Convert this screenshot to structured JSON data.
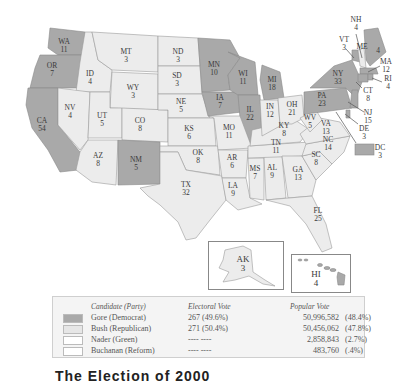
{
  "map": {
    "title": "2000 Presidential Election Results",
    "colors": {
      "gore": "#a9a9a9",
      "bush": "#ececec",
      "nader": "#ffffff",
      "buchanan": "#ffffff"
    },
    "states": [
      {
        "abbr": "WA",
        "ev": "11",
        "winner": "gore"
      },
      {
        "abbr": "OR",
        "ev": "7",
        "winner": "gore"
      },
      {
        "abbr": "CA",
        "ev": "54",
        "winner": "gore"
      },
      {
        "abbr": "ID",
        "ev": "4",
        "winner": "bush"
      },
      {
        "abbr": "NV",
        "ev": "4",
        "winner": "bush"
      },
      {
        "abbr": "MT",
        "ev": "3",
        "winner": "bush"
      },
      {
        "abbr": "WY",
        "ev": "3",
        "winner": "bush"
      },
      {
        "abbr": "UT",
        "ev": "5",
        "winner": "bush"
      },
      {
        "abbr": "AZ",
        "ev": "8",
        "winner": "bush"
      },
      {
        "abbr": "CO",
        "ev": "8",
        "winner": "bush"
      },
      {
        "abbr": "NM",
        "ev": "5",
        "winner": "gore"
      },
      {
        "abbr": "ND",
        "ev": "3",
        "winner": "bush"
      },
      {
        "abbr": "SD",
        "ev": "3",
        "winner": "bush"
      },
      {
        "abbr": "NE",
        "ev": "5",
        "winner": "bush"
      },
      {
        "abbr": "KS",
        "ev": "6",
        "winner": "bush"
      },
      {
        "abbr": "OK",
        "ev": "8",
        "winner": "bush"
      },
      {
        "abbr": "TX",
        "ev": "32",
        "winner": "bush"
      },
      {
        "abbr": "MN",
        "ev": "10",
        "winner": "gore"
      },
      {
        "abbr": "IA",
        "ev": "7",
        "winner": "gore"
      },
      {
        "abbr": "MO",
        "ev": "11",
        "winner": "bush"
      },
      {
        "abbr": "AR",
        "ev": "6",
        "winner": "bush"
      },
      {
        "abbr": "LA",
        "ev": "9",
        "winner": "bush"
      },
      {
        "abbr": "WI",
        "ev": "11",
        "winner": "gore"
      },
      {
        "abbr": "IL",
        "ev": "22",
        "winner": "gore"
      },
      {
        "abbr": "MI",
        "ev": "18",
        "winner": "gore"
      },
      {
        "abbr": "IN",
        "ev": "12",
        "winner": "bush"
      },
      {
        "abbr": "OH",
        "ev": "21",
        "winner": "bush"
      },
      {
        "abbr": "KY",
        "ev": "8",
        "winner": "bush"
      },
      {
        "abbr": "TN",
        "ev": "11",
        "winner": "bush"
      },
      {
        "abbr": "MS",
        "ev": "7",
        "winner": "bush"
      },
      {
        "abbr": "AL",
        "ev": "9",
        "winner": "bush"
      },
      {
        "abbr": "GA",
        "ev": "13",
        "winner": "bush"
      },
      {
        "abbr": "FL",
        "ev": "25",
        "winner": "bush"
      },
      {
        "abbr": "SC",
        "ev": "8",
        "winner": "bush"
      },
      {
        "abbr": "NC",
        "ev": "14",
        "winner": "bush"
      },
      {
        "abbr": "VA",
        "ev": "13",
        "winner": "bush"
      },
      {
        "abbr": "WV",
        "ev": "5",
        "winner": "bush"
      },
      {
        "abbr": "PA",
        "ev": "23",
        "winner": "gore"
      },
      {
        "abbr": "NY",
        "ev": "33",
        "winner": "gore"
      },
      {
        "abbr": "VT",
        "ev": "3",
        "winner": "gore"
      },
      {
        "abbr": "NH",
        "ev": "4",
        "winner": "bush"
      },
      {
        "abbr": "ME",
        "ev": "4",
        "winner": "gore"
      },
      {
        "abbr": "MA",
        "ev": "12",
        "winner": "gore"
      },
      {
        "abbr": "RI",
        "ev": "4",
        "winner": "gore"
      },
      {
        "abbr": "CT",
        "ev": "8",
        "winner": "gore"
      },
      {
        "abbr": "NJ",
        "ev": "15",
        "winner": "gore"
      },
      {
        "abbr": "DE",
        "ev": "3",
        "winner": "gore"
      },
      {
        "abbr": "DC",
        "ev": "3",
        "winner": "gore"
      },
      {
        "abbr": "AK",
        "ev": "3",
        "winner": "bush"
      },
      {
        "abbr": "HI",
        "ev": "4",
        "winner": "gore"
      }
    ]
  },
  "labels": {
    "WA": [
      "WA",
      "11"
    ],
    "OR": [
      "OR",
      "7"
    ],
    "CA": [
      "CA",
      "54"
    ],
    "ID": [
      "ID",
      "4"
    ],
    "NV": [
      "NV",
      "4"
    ],
    "MT": [
      "MT",
      "3"
    ],
    "WY": [
      "WY",
      "3"
    ],
    "UT": [
      "UT",
      "5"
    ],
    "AZ": [
      "AZ",
      "8"
    ],
    "CO": [
      "CO",
      "8"
    ],
    "NM": [
      "NM",
      "5"
    ],
    "ND": [
      "ND",
      "3"
    ],
    "SD": [
      "SD",
      "3"
    ],
    "NE": [
      "NE",
      "5"
    ],
    "KS": [
      "KS",
      "6"
    ],
    "OK": [
      "OK",
      "8"
    ],
    "TX": [
      "TX",
      "32"
    ],
    "MN": [
      "MN",
      "10"
    ],
    "IA": [
      "IA",
      "7"
    ],
    "MO": [
      "MO",
      "11"
    ],
    "AR": [
      "AR",
      "6"
    ],
    "LA": [
      "LA",
      "9"
    ],
    "WI": [
      "WI",
      "11"
    ],
    "IL": [
      "IL",
      "22"
    ],
    "MI": [
      "MI",
      "18"
    ],
    "IN": [
      "IN",
      "12"
    ],
    "OH": [
      "OH",
      "21"
    ],
    "KY": [
      "KY",
      "8"
    ],
    "TN": [
      "TN",
      "11"
    ],
    "MS": [
      "MS",
      "7"
    ],
    "AL": [
      "AL",
      "9"
    ],
    "GA": [
      "GA",
      "13"
    ],
    "FL": [
      "FL",
      "25"
    ],
    "SC": [
      "SC",
      "8"
    ],
    "NC": [
      "NC",
      "14"
    ],
    "VA": [
      "VA",
      "13"
    ],
    "WV": [
      "WV",
      "5"
    ],
    "PA": [
      "PA",
      "23"
    ],
    "NY": [
      "NY",
      "33"
    ],
    "VT": [
      "VT",
      "3"
    ],
    "NH": [
      "NH",
      "4"
    ],
    "ME": [
      "ME",
      "4"
    ],
    "MA": [
      "MA",
      "12"
    ],
    "RI": [
      "RI",
      "4"
    ],
    "CT": [
      "CT",
      "8"
    ],
    "NJ": [
      "NJ",
      "15"
    ],
    "DE": [
      "DE",
      "3"
    ],
    "DC": [
      "DC",
      "3"
    ],
    "AK": [
      "AK",
      "3"
    ],
    "HI": [
      "HI",
      "4"
    ]
  },
  "legend": {
    "headers": {
      "candidate": "Candidate (Party)",
      "electoral": "Electoral Vote",
      "popular": "Popular Vote"
    },
    "rows": [
      {
        "name": "Gore (Democrat)",
        "ev": "267  (49.6%)",
        "pv": "50,996,582",
        "pvp": "(48.4%)",
        "color": "#a9a9a9"
      },
      {
        "name": "Bush (Republican)",
        "ev": "271  (50.4%)",
        "pv": "50,456,062",
        "pvp": "(47.8%)",
        "color": "#e6e6e6"
      },
      {
        "name": "Nader (Green)",
        "ev": "----     ----",
        "pv": "2,858,843",
        "pvp": "(2.7%)",
        "color": "#ffffff"
      },
      {
        "name": "Buchanan (Reform)",
        "ev": "----     ----",
        "pv": "483,760",
        "pvp": "(.4%)",
        "color": "#ffffff"
      }
    ]
  },
  "caption": {
    "text": "The Election of 2000"
  }
}
